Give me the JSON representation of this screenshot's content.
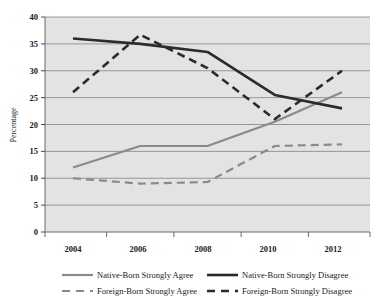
{
  "chart_data": {
    "type": "line",
    "title": "",
    "xlabel": "",
    "ylabel": "Percentage",
    "x": [
      "2004",
      "2006",
      "2008",
      "2010",
      "2012"
    ],
    "categories": [
      "2004",
      "2006",
      "2008",
      "2010",
      "2012"
    ],
    "ylim": [
      0,
      40
    ],
    "yticks": [
      "0",
      "5",
      "10",
      "15",
      "20",
      "25",
      "30",
      "35",
      "40"
    ],
    "grid": true,
    "legend_position": "bottom",
    "plot_background": "#e3e3e3",
    "series": [
      {
        "name": "Native-Born Strongly Agree",
        "values": [
          12,
          16,
          16,
          20.5,
          26
        ],
        "color": "#8a8a8a",
        "style": "solid"
      },
      {
        "name": "Native-Born Strongly Disagree",
        "values": [
          36,
          35,
          33.5,
          25.5,
          23
        ],
        "color": "#2b2b2b",
        "style": "solid"
      },
      {
        "name": "Foreign-Born Strongly Agree",
        "values": [
          10,
          9,
          9.3,
          16,
          16.3
        ],
        "color": "#8a8a8a",
        "style": "dashed"
      },
      {
        "name": "Foreign-Born Strongly Disagree",
        "values": [
          26,
          36.7,
          30.5,
          21,
          30
        ],
        "color": "#2b2b2b",
        "style": "dashed"
      }
    ]
  },
  "axis": {
    "y_title": "Percentage",
    "y_tick_40": "40",
    "y_tick_35": "35",
    "y_tick_30": "30",
    "y_tick_25": "25",
    "y_tick_20": "20",
    "y_tick_15": "15",
    "y_tick_10": "10",
    "y_tick_5": "5",
    "y_tick_0": "0",
    "x_tick_0": "2004",
    "x_tick_1": "2006",
    "x_tick_2": "2008",
    "x_tick_3": "2010",
    "x_tick_4": "2012"
  },
  "legend": {
    "item_0": "Native-Born Strongly Agree",
    "item_1": "Native-Born Strongly Disagree",
    "item_2": "Foreign-Born Strongly Agree",
    "item_3": "Foreign-Born Strongly Disagree"
  }
}
